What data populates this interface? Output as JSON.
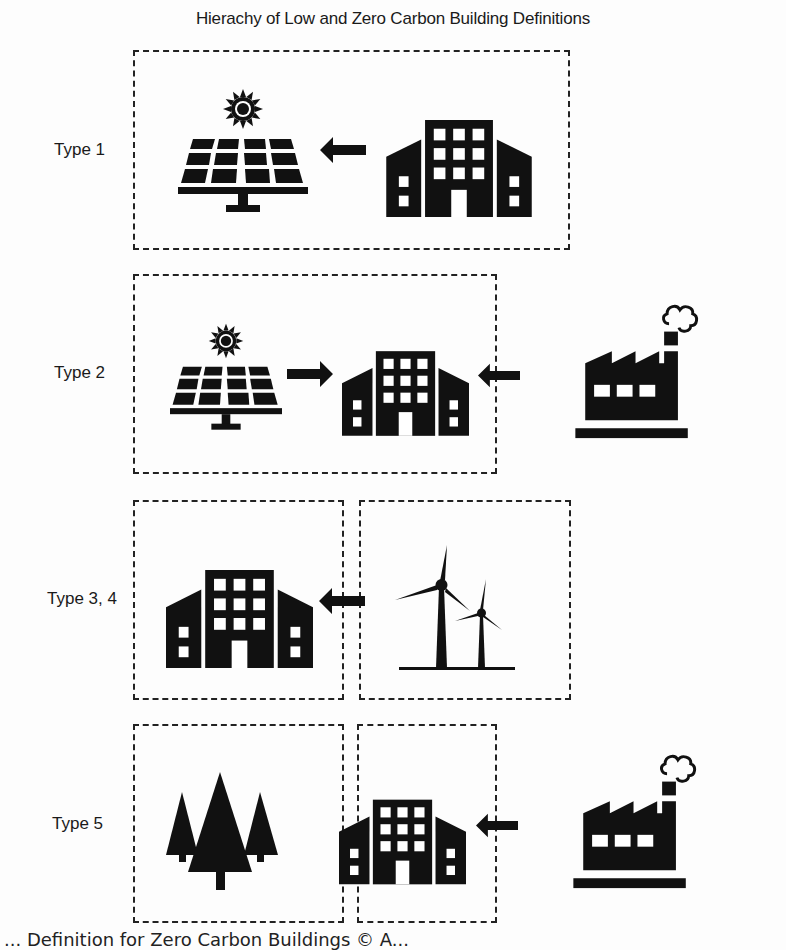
{
  "title": "Hierachy of Low and Zero Carbon Building Definitions",
  "rows": [
    {
      "label": "Type 1",
      "flow": [
        "solar-panel",
        "arrow-left",
        "building"
      ]
    },
    {
      "label": "Type 2",
      "flow": [
        "solar-panel",
        "arrow-right",
        "building",
        "arrow-left",
        "factory"
      ]
    },
    {
      "label": "Type 3, 4",
      "flow": [
        "building",
        "arrow-left",
        "wind-turbines"
      ]
    },
    {
      "label": "Type 5",
      "flow": [
        "trees",
        "building",
        "arrow-left",
        "factory"
      ]
    }
  ],
  "caption": "... Definition for Zero Carbon Buildings © A..."
}
